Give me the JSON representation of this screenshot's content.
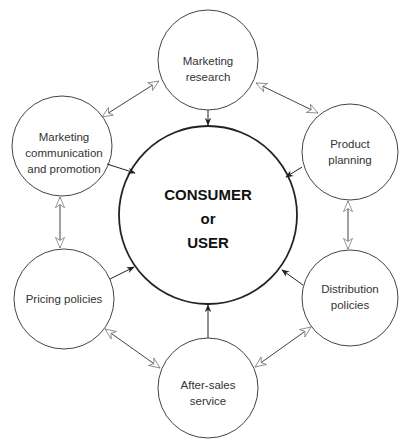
{
  "diagram": {
    "center": {
      "line1": "CONSUMER",
      "line2": "or",
      "line3": "USER"
    },
    "nodes": [
      {
        "id": "marketing-research",
        "line1": "Marketing",
        "line2": "research"
      },
      {
        "id": "product-planning",
        "line1": "Product",
        "line2": "planning"
      },
      {
        "id": "distribution-policies",
        "line1": "Distribution",
        "line2": "policies"
      },
      {
        "id": "after-sales-service",
        "line1": "After-sales",
        "line2": "service"
      },
      {
        "id": "pricing-policies",
        "line1": "Pricing policies"
      },
      {
        "id": "marketing-communication",
        "line1": "Marketing",
        "line2": "communication",
        "line3": "and promotion"
      }
    ],
    "colors": {
      "stroke": "#333333",
      "background": "#ffffff"
    }
  }
}
